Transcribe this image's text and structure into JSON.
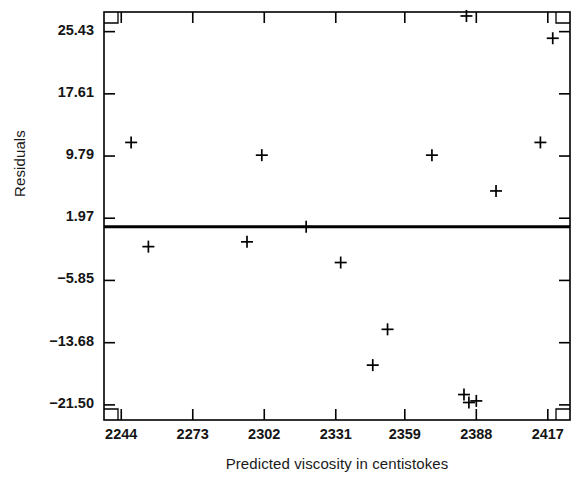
{
  "chart_data": {
    "type": "scatter",
    "title": "",
    "xlabel": "Predicted viscosity in centistokes",
    "ylabel": "Residuals",
    "xlim": [
      2237,
      2426
    ],
    "ylim": [
      -23.4,
      27.9
    ],
    "grid": false,
    "legend": null,
    "marker": "plus",
    "xticks": [
      2244,
      2273,
      2302,
      2331,
      2359,
      2388,
      2417
    ],
    "xtick_labels": [
      "2244",
      "2273",
      "2302",
      "2331",
      "2359",
      "2388",
      "2417"
    ],
    "yticks": [
      25.43,
      17.61,
      9.79,
      1.97,
      -5.85,
      -13.68,
      -21.5
    ],
    "ytick_labels": [
      "25.43",
      "17.61",
      "9.79",
      "1.97",
      "−5.85",
      "−13.68",
      "−21.50"
    ],
    "reference_line": {
      "orientation": "horizontal",
      "y": 0.9,
      "label": "zero-residual-line",
      "color": "#000000",
      "width_px": 3
    },
    "x": [
      2384,
      2419,
      2248,
      2301,
      2370,
      2414,
      2396,
      2319,
      2295,
      2255,
      2333,
      2352,
      2346,
      2383,
      2385,
      2388
    ],
    "y": [
      27.4,
      24.6,
      11.5,
      9.9,
      9.9,
      11.5,
      5.4,
      0.9,
      -1.0,
      -1.6,
      -3.6,
      -12.0,
      -16.5,
      -20.2,
      -21.2,
      -21.0
    ],
    "points": [
      {
        "x": 2384,
        "y": 27.4
      },
      {
        "x": 2419,
        "y": 24.6
      },
      {
        "x": 2248,
        "y": 11.5
      },
      {
        "x": 2301,
        "y": 9.9
      },
      {
        "x": 2370,
        "y": 9.9
      },
      {
        "x": 2414,
        "y": 11.5
      },
      {
        "x": 2396,
        "y": 5.4
      },
      {
        "x": 2319,
        "y": 0.9
      },
      {
        "x": 2295,
        "y": -1.0
      },
      {
        "x": 2255,
        "y": -1.6
      },
      {
        "x": 2333,
        "y": -3.6
      },
      {
        "x": 2352,
        "y": -12.0
      },
      {
        "x": 2346,
        "y": -16.5
      },
      {
        "x": 2383,
        "y": -20.2
      },
      {
        "x": 2385,
        "y": -21.2
      },
      {
        "x": 2388,
        "y": -21.0
      }
    ],
    "n_points": 16,
    "colors": {
      "marker": "#000000",
      "axis": "#000000",
      "background": "#ffffff",
      "text": "#151515"
    }
  }
}
